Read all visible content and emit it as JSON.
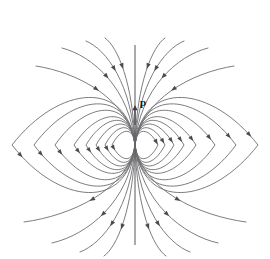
{
  "figure": {
    "background_color": "#ffffff",
    "line_color": "#6e6e72",
    "arrow_color": "#4a4a50",
    "axis_color": "#5d5d62",
    "label_color": "#18181c",
    "width": 270,
    "height": 259
  },
  "labels": {
    "dipole_moment": "p"
  },
  "chart_data": {
    "type": "diagram",
    "subtitle": "",
    "xlabel": "",
    "ylabel": "",
    "center": {
      "x": 135,
      "y": 145
    },
    "axis": {
      "x": 135,
      "y_top": 45,
      "y_bottom": 245
    },
    "moment_arrow": {
      "x": 135,
      "y_tail": 125,
      "y_head": 105
    },
    "moment_label": {
      "text": "p",
      "x": 140,
      "y": 103
    },
    "loops_left": [
      {
        "rx": 123,
        "ry": 52,
        "arrow_t": 0.5
      },
      {
        "rx": 101,
        "ry": 45,
        "arrow_t": 0.5
      },
      {
        "rx": 80,
        "ry": 38,
        "arrow_t": 0.5
      },
      {
        "rx": 61,
        "ry": 31,
        "arrow_t": 0.5
      },
      {
        "rx": 49,
        "ry": 27,
        "arrow_t": 0.5
      },
      {
        "rx": 39,
        "ry": 23,
        "arrow_t": 0.5
      },
      {
        "rx": 30,
        "ry": 19,
        "arrow_t": 0.5
      },
      {
        "rx": 23,
        "ry": 15,
        "arrow_t": 0.5
      }
    ],
    "loops_right": [
      {
        "rx": 123,
        "ry": 52,
        "arrow_t": 0.5
      },
      {
        "rx": 101,
        "ry": 45,
        "arrow_t": 0.5
      },
      {
        "rx": 80,
        "ry": 38,
        "arrow_t": 0.5
      },
      {
        "rx": 61,
        "ry": 31,
        "arrow_t": 0.5
      },
      {
        "rx": 49,
        "ry": 27,
        "arrow_t": 0.5
      },
      {
        "rx": 39,
        "ry": 23,
        "arrow_t": 0.5
      },
      {
        "rx": 30,
        "ry": 19,
        "arrow_t": 0.5
      },
      {
        "rx": 23,
        "ry": 15,
        "arrow_t": 0.5
      }
    ],
    "open_lines_upper_left": [
      {
        "end_x": 36,
        "end_y": 66,
        "arrow_t": 0.52
      },
      {
        "end_x": 62,
        "end_y": 48,
        "arrow_t": 0.52
      },
      {
        "end_x": 86,
        "end_y": 41,
        "arrow_t": 0.55
      },
      {
        "end_x": 105,
        "end_y": 38,
        "arrow_t": 0.55
      }
    ],
    "open_lines_upper_right": [
      {
        "end_x": 234,
        "end_y": 66,
        "arrow_t": 0.52
      },
      {
        "end_x": 208,
        "end_y": 48,
        "arrow_t": 0.52
      },
      {
        "end_x": 184,
        "end_y": 41,
        "arrow_t": 0.55
      },
      {
        "end_x": 165,
        "end_y": 38,
        "arrow_t": 0.55
      }
    ],
    "open_lines_lower_left": [
      {
        "end_x": 24,
        "end_y": 222,
        "arrow_t": 0.52
      },
      {
        "end_x": 52,
        "end_y": 243,
        "arrow_t": 0.52
      },
      {
        "end_x": 80,
        "end_y": 252,
        "arrow_t": 0.55
      },
      {
        "end_x": 104,
        "end_y": 256,
        "arrow_t": 0.55
      }
    ],
    "open_lines_lower_right": [
      {
        "end_x": 246,
        "end_y": 222,
        "arrow_t": 0.52
      },
      {
        "end_x": 218,
        "end_y": 243,
        "arrow_t": 0.52
      },
      {
        "end_x": 190,
        "end_y": 252,
        "arrow_t": 0.55
      },
      {
        "end_x": 166,
        "end_y": 256,
        "arrow_t": 0.55
      }
    ],
    "legend": [],
    "grid": false
  }
}
